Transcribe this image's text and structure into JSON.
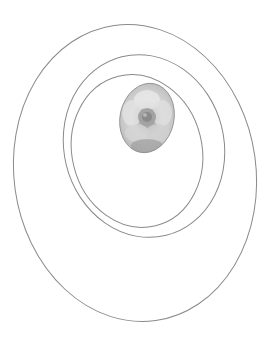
{
  "image": {
    "width": 269,
    "height": 346,
    "background": "#ffffff",
    "description": "Three nested tilted oval outlines with a grayscale flower photo in a small oval"
  },
  "colors": {
    "line": "#8a8a8a",
    "photo_light": "#e6e6e6",
    "photo_mid": "#b8b8b8",
    "photo_dark": "#7d7d7d"
  },
  "ovals": [
    {
      "name": "outer",
      "cx": 135,
      "cy": 173,
      "rx": 121,
      "ry": 149,
      "rotate": -8
    },
    {
      "name": "middle",
      "cx": 144,
      "cy": 146,
      "rx": 80,
      "ry": 92,
      "rotate": -14
    },
    {
      "name": "inner",
      "cx": 137,
      "cy": 151,
      "rx": 65,
      "ry": 77,
      "rotate": -14
    }
  ],
  "photo": {
    "subject": "flower",
    "cx": 147,
    "cy": 118,
    "rx": 27,
    "ry": 35,
    "rotate": 12
  }
}
